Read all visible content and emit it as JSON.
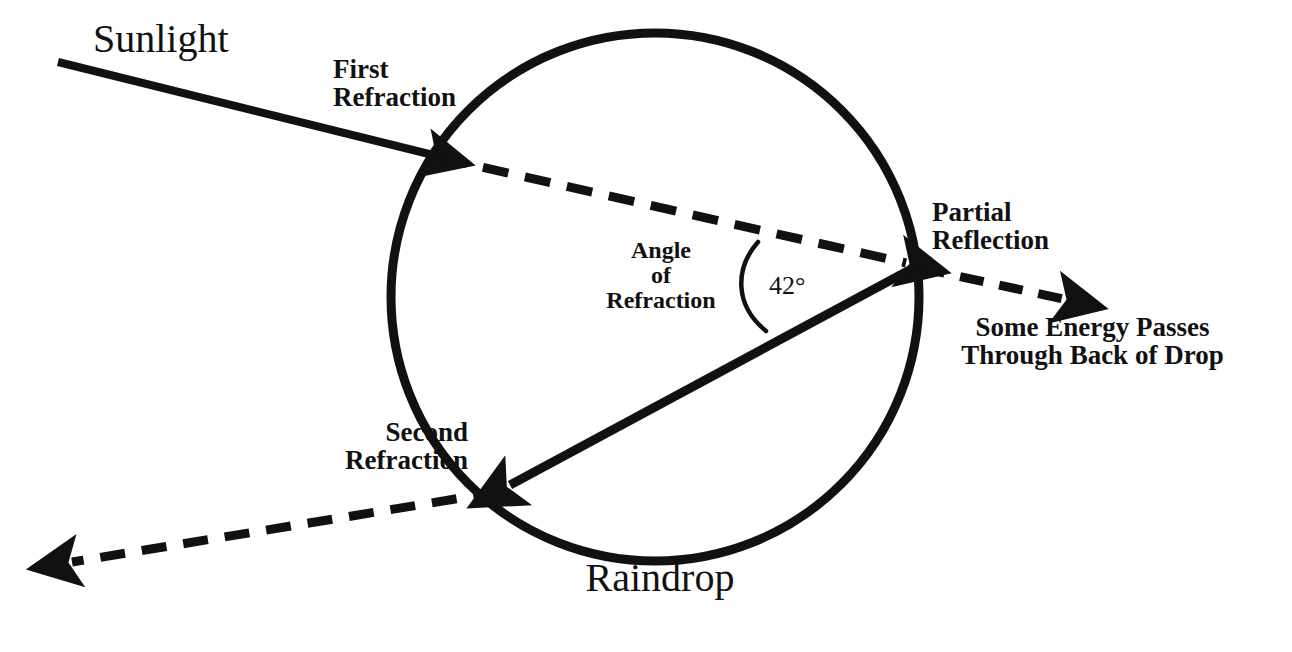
{
  "figure": {
    "background_color": "#ffffff",
    "ink_color": "#111111"
  },
  "labels": {
    "sunlight": "Sunlight",
    "first_refraction": "First\nRefraction",
    "angle_of_refraction": "Angle\nof\nRefraction",
    "angle_value": "42°",
    "partial_reflection": "Partial\nReflection",
    "some_energy": "Some Energy Passes\nThrough Back of Drop",
    "second_refraction": "Second\nRefraction",
    "raindrop": "Raindrop"
  },
  "geometry": {
    "drop": {
      "cx": 655,
      "cy": 297,
      "r": 264,
      "stroke_width": 9
    },
    "points": {
      "sun_start": {
        "x": 58,
        "y": 62
      },
      "entry": {
        "x": 441,
        "y": 158
      },
      "back_reflection": {
        "x": 917,
        "y": 266
      },
      "exit": {
        "x": 498,
        "y": 492
      },
      "transmit_end": {
        "x": 1077,
        "y": 303
      },
      "final_end": {
        "x": 55,
        "y": 566
      }
    },
    "rays": [
      {
        "name": "incident-sunlight-ray",
        "style": "solid",
        "arrow": "end"
      },
      {
        "name": "refracted-internal-ray",
        "style": "dashed",
        "arrow": "end"
      },
      {
        "name": "internal-reflected-ray",
        "style": "solid",
        "arrow": "end"
      },
      {
        "name": "transmitted-back-ray",
        "style": "dashed",
        "arrow": "end"
      },
      {
        "name": "exiting-refracted-ray",
        "style": "dashed",
        "arrow": "end"
      }
    ],
    "angle_arc": {
      "vertex_x": 917,
      "vertex_y": 266,
      "radius": 163,
      "value_deg": 42
    }
  }
}
